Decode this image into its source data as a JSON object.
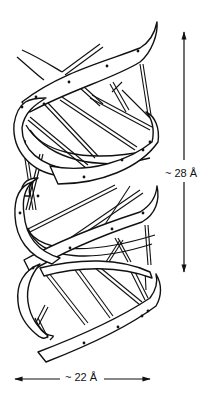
{
  "figure": {
    "ink_color": "#111111",
    "background_color": "#ffffff"
  },
  "dimensions": {
    "pitch": {
      "label": "~ 28 Å",
      "orientation": "vertical",
      "value_angstrom": 28,
      "approx": true
    },
    "diameter": {
      "label": "~ 22 Å",
      "orientation": "horizontal",
      "value_angstrom": 22,
      "approx": true
    }
  },
  "icons": {
    "arrow_up": "arrowhead-up",
    "arrow_down": "arrowhead-down",
    "arrow_left": "arrowhead-left",
    "arrow_right": "arrowhead-right"
  }
}
